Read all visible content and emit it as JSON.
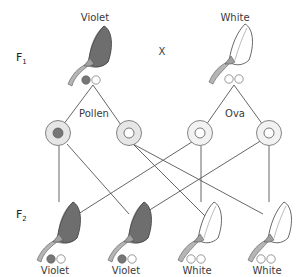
{
  "diagram": {
    "type": "genetic-cross",
    "parents": {
      "generation_label": "F",
      "generation_index": "1",
      "cross_symbol": "X",
      "left": {
        "phenotype": "Violet",
        "alleles": [
          "dominant",
          "recessive"
        ]
      },
      "right": {
        "phenotype": "White",
        "alleles": [
          "recessive",
          "recessive"
        ]
      }
    },
    "gametes": {
      "pollen_label": "Pollen",
      "ova_label": "Ova",
      "pollen": [
        "dominant",
        "recessive"
      ],
      "ova": [
        "recessive",
        "recessive"
      ]
    },
    "offspring": {
      "generation_label": "F",
      "generation_index": "2",
      "items": [
        {
          "phenotype": "Violet",
          "alleles": [
            "dominant",
            "recessive"
          ]
        },
        {
          "phenotype": "Violet",
          "alleles": [
            "dominant",
            "recessive"
          ]
        },
        {
          "phenotype": "White",
          "alleles": [
            "recessive",
            "recessive"
          ]
        },
        {
          "phenotype": "White",
          "alleles": [
            "recessive",
            "recessive"
          ]
        }
      ]
    },
    "colors": {
      "violet_fill": "#6e6e6e",
      "gamete_ring": "#e6e6e6",
      "stem": "#a9a9a9",
      "line": "#555555"
    }
  }
}
